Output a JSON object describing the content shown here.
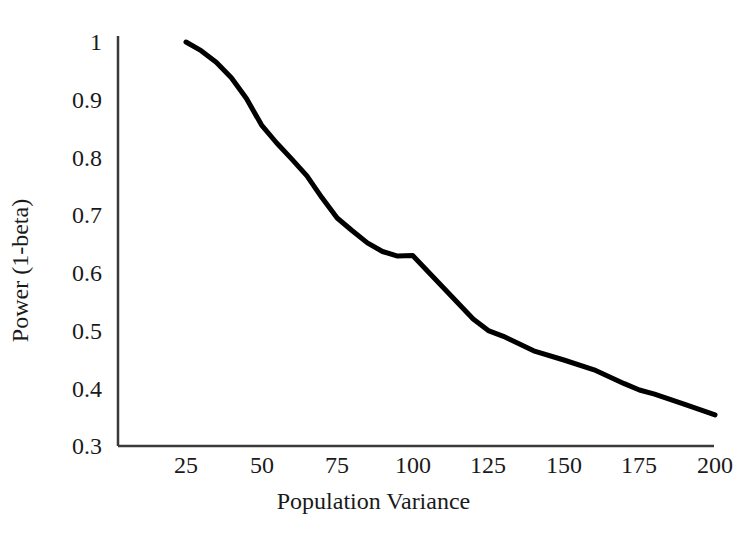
{
  "chart_data": {
    "type": "line",
    "title": "",
    "xlabel": "Population Variance",
    "ylabel": "Power (1-beta)",
    "xlim": [
      12.5,
      200
    ],
    "ylim": [
      0.3,
      1.0
    ],
    "grid": false,
    "legend": "none",
    "xticks": [
      "25",
      "50",
      "75",
      "100",
      "125",
      "150",
      "175",
      "200"
    ],
    "xtick_values": [
      25,
      50,
      75,
      100,
      125,
      150,
      175,
      200
    ],
    "yticks": [
      "1",
      "0.9",
      "0.8",
      "0.7",
      "0.6",
      "0.5",
      "0.4",
      "0.3"
    ],
    "ytick_values": [
      1,
      0.9,
      0.8,
      0.7,
      0.6,
      0.5,
      0.4,
      0.3
    ],
    "series": [
      {
        "name": "Power",
        "color": "#000000",
        "line_width": 5,
        "x": [
          25,
          30,
          35,
          40,
          45,
          50,
          55,
          60,
          65,
          70,
          75,
          80,
          85,
          90,
          95,
          100,
          110,
          120,
          125,
          130,
          140,
          150,
          160,
          170,
          175,
          180,
          190,
          200
        ],
        "values": [
          1.0,
          0.985,
          0.965,
          0.938,
          0.902,
          0.856,
          0.825,
          0.797,
          0.768,
          0.73,
          0.695,
          0.673,
          0.652,
          0.637,
          0.629,
          0.63,
          0.575,
          0.52,
          0.5,
          0.49,
          0.465,
          0.449,
          0.432,
          0.408,
          0.397,
          0.39,
          0.372,
          0.354
        ]
      }
    ]
  },
  "axes": {
    "x_axis_name": "x-axis-line",
    "y_axis_name": "y-axis-line",
    "axis_color": "#3a3a3a"
  }
}
